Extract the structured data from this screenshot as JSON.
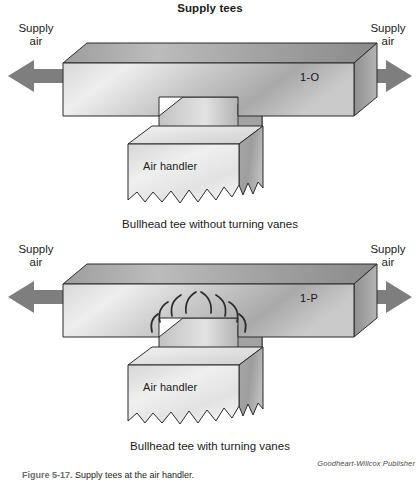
{
  "figure": {
    "title": "Supply tees",
    "credit": "Goodheart-Willcox Publisher",
    "caption_number": "Figure 5-17.",
    "caption_text": "Supply tees at the air handler."
  },
  "palette": {
    "duct_top_light": "#b6b6b6",
    "duct_top_dark": "#8c8c8c",
    "duct_front_light": "#e9e9e9",
    "duct_front_dark": "#9a9a9a",
    "duct_end": "#9c9c9c",
    "arrow_fill": "#7e7e7e",
    "air_handler_light": "#ededed",
    "air_handler_dark": "#a6a6a6",
    "outline": "#2b2b2b",
    "vane_stroke": "#2b2b2b",
    "text": "#1b1b1b"
  },
  "diagrams": [
    {
      "id": "top",
      "duct_code": "1-O",
      "left_label": "Supply\nair",
      "right_label": "Supply\nair",
      "air_handler_label": "Air handler",
      "caption": "Bullhead tee without turning vanes",
      "has_turning_vanes": false,
      "vane_count": 0
    },
    {
      "id": "bottom",
      "duct_code": "1-P",
      "left_label": "Supply\nair",
      "right_label": "Supply\nair",
      "air_handler_label": "Air handler",
      "caption": "Bullhead tee with turning vanes",
      "has_turning_vanes": true,
      "vane_count": 8
    }
  ]
}
